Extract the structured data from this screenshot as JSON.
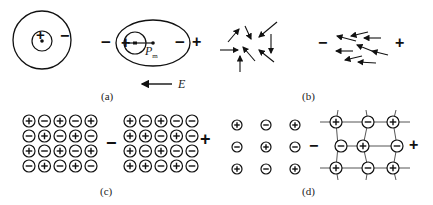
{
  "figure": {
    "panels": [
      {
        "id": "a",
        "label": "(a)"
      },
      {
        "id": "b",
        "label": "(b)"
      },
      {
        "id": "c",
        "label": "(c)"
      },
      {
        "id": "d",
        "label": "(d)"
      }
    ],
    "panel_a": {
      "atom_unpolarized": {
        "nucleus_sign": "+",
        "cloud_sign": "−"
      },
      "atom_polarized": {
        "left_sign": "−",
        "nucleus_sign": "+",
        "cloud_sign": "−",
        "right_sign": "+",
        "moment_label": "P",
        "moment_subscript": "m"
      },
      "field_label": "E"
    },
    "panel_b": {
      "left_sign": "−",
      "right_sign": "+"
    },
    "panel_c": {
      "left_sign": "−",
      "right_sign": "+",
      "grid_unpolarized": [
        [
          "+",
          "−",
          "+",
          "−",
          "+"
        ],
        [
          "−",
          "+",
          "−",
          "+",
          "−"
        ],
        [
          "+",
          "−",
          "+",
          "−",
          "+"
        ],
        [
          "−",
          "+",
          "−",
          "+",
          "−"
        ]
      ],
      "grid_polarized": [
        [
          "+",
          "−",
          "+",
          "−",
          "−"
        ],
        [
          "+",
          "+",
          "−",
          "+",
          "−"
        ],
        [
          "+",
          "−",
          "+",
          "−",
          "−"
        ],
        [
          "+",
          "+",
          "−",
          "+",
          "−"
        ]
      ]
    },
    "panel_d": {
      "left_sign": "−",
      "right_sign": "+",
      "lattice_unpolarized": [
        [
          "+",
          "−",
          "+"
        ],
        [
          "−",
          "+",
          "−"
        ],
        [
          "+",
          "−",
          "+"
        ]
      ],
      "lattice_polarized": [
        [
          "+",
          "−",
          "+"
        ],
        [
          "−",
          "+",
          "−"
        ],
        [
          "+",
          "−",
          "+"
        ]
      ]
    },
    "colors": {
      "ink": "#111111",
      "background": "#ffffff"
    }
  }
}
